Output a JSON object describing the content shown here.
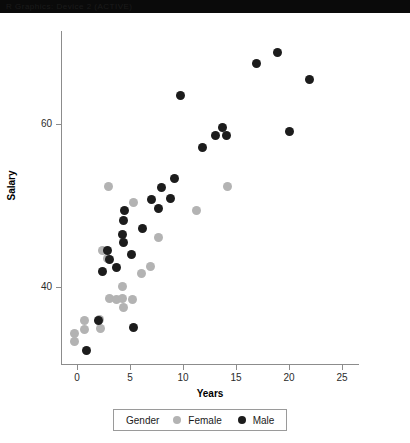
{
  "window": {
    "titlebar_text": "R Graphics: Device 2 (ACTIVE)"
  },
  "colors": {
    "female": "#b3b3b3",
    "male": "#1c1c1c",
    "axis": "#8c8c8c",
    "text": "#1a1a1a",
    "background": "#ffffff"
  },
  "legend": {
    "title": "Gender",
    "entries": [
      {
        "label": "Female",
        "color": "#b3b3b3"
      },
      {
        "label": "Male",
        "color": "#1c1c1c"
      }
    ]
  },
  "chart_data": {
    "type": "scatter",
    "title": "",
    "xlabel": "Years",
    "ylabel": "Salary",
    "xlim": [
      -1.5,
      26.5
    ],
    "ylim": [
      30.5,
      71.5
    ],
    "xticks": [
      0,
      5,
      10,
      15,
      20,
      25
    ],
    "yticks": [
      40,
      60
    ],
    "grid": false,
    "legend_position": "bottom",
    "series": [
      {
        "name": "Female",
        "color": "#b3b3b3",
        "points": [
          [
            -0.2,
            34.3
          ],
          [
            -0.2,
            33.3
          ],
          [
            0.7,
            35.9
          ],
          [
            0.7,
            34.8
          ],
          [
            2.1,
            36.0
          ],
          [
            2.2,
            34.9
          ],
          [
            2.4,
            44.5
          ],
          [
            3.0,
            52.3
          ],
          [
            2.9,
            43.5
          ],
          [
            3.1,
            38.6
          ],
          [
            3.7,
            38.5
          ],
          [
            4.3,
            40.0
          ],
          [
            4.3,
            38.6
          ],
          [
            4.4,
            37.4
          ],
          [
            5.2,
            38.5
          ],
          [
            5.3,
            50.4
          ],
          [
            6.1,
            41.6
          ],
          [
            6.9,
            42.5
          ],
          [
            7.7,
            46.1
          ],
          [
            11.3,
            49.4
          ],
          [
            14.2,
            52.4
          ]
        ]
      },
      {
        "name": "Male",
        "color": "#1c1c1c",
        "points": [
          [
            0.9,
            32.2
          ],
          [
            2.0,
            35.9
          ],
          [
            2.4,
            41.9
          ],
          [
            2.9,
            44.5
          ],
          [
            3.1,
            43.4
          ],
          [
            3.7,
            42.4
          ],
          [
            4.3,
            46.5
          ],
          [
            4.4,
            45.5
          ],
          [
            4.4,
            48.2
          ],
          [
            4.5,
            49.4
          ],
          [
            5.1,
            44.0
          ],
          [
            5.3,
            35.0
          ],
          [
            6.2,
            47.2
          ],
          [
            7.0,
            50.8
          ],
          [
            7.7,
            49.6
          ],
          [
            8.0,
            52.2
          ],
          [
            8.8,
            50.9
          ],
          [
            9.2,
            53.4
          ],
          [
            9.8,
            63.6
          ],
          [
            11.8,
            57.1
          ],
          [
            13.1,
            58.6
          ],
          [
            13.7,
            59.6
          ],
          [
            14.1,
            58.6
          ],
          [
            16.9,
            67.5
          ],
          [
            18.9,
            68.8
          ],
          [
            20.0,
            59.1
          ],
          [
            21.9,
            65.5
          ]
        ]
      }
    ]
  }
}
